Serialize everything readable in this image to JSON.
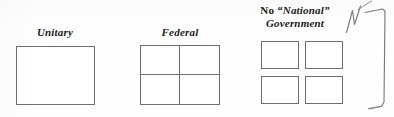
{
  "figure": {
    "background_color": "#fefefe",
    "ink_color": "#6d6d72",
    "annotation_color": "#7a7a80"
  },
  "diagrams": [
    {
      "id": "unitary",
      "label": "Unitary",
      "label_lines": [
        "Unitary"
      ],
      "structure": "single-box",
      "cell_count": 1
    },
    {
      "id": "federal",
      "label": "Federal",
      "label_lines": [
        "Federal"
      ],
      "structure": "box-divided-in-quadrants",
      "cell_count": 4
    },
    {
      "id": "confederal",
      "label": "No “National” Government",
      "label_lines": [
        "No “National”",
        "Government"
      ],
      "label_line_1_prefix": "No ",
      "label_line_1_quoted": "“National”",
      "label_line_2": "Government",
      "structure": "four-separate-boxes",
      "cell_count": 4
    }
  ],
  "annotations": [
    {
      "id": "check-mark",
      "kind": "handwritten-zigzag-mark",
      "text": ""
    },
    {
      "id": "right-bracket",
      "kind": "handwritten-bracket",
      "text": ""
    }
  ]
}
